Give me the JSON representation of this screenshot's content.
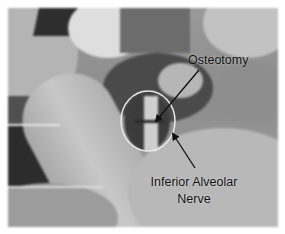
{
  "figure": {
    "type": "grayscale intraoperative photograph",
    "annotations": [
      {
        "id": "osteotomy",
        "text": "Osteotomy"
      },
      {
        "id": "nerve",
        "lines": [
          "Inferior Alveolar",
          "Nerve"
        ]
      }
    ],
    "highlight": {
      "shape": "circle",
      "color": "#e8e8e8"
    },
    "arrow_color": "#111111"
  }
}
